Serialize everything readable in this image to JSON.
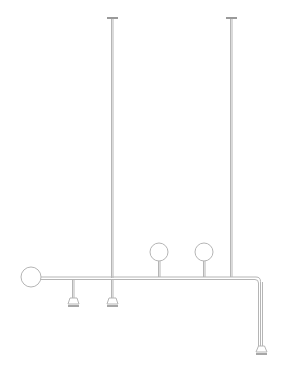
{
  "drawing": {
    "title": "Pendant light fixture line drawing",
    "stroke_color": "#b5b5b5",
    "dark_stroke": "#8a8a8a",
    "background": "#ffffff",
    "canopies": [
      {
        "x": 112,
        "y": 18
      },
      {
        "x": 231,
        "y": 18
      }
    ],
    "globes": [
      {
        "cx": 31,
        "cy": 277,
        "r": 10
      },
      {
        "cx": 159,
        "cy": 252,
        "r": 9
      },
      {
        "cx": 204,
        "cy": 252,
        "r": 9
      }
    ],
    "shades": [
      {
        "x": 73,
        "top": 278,
        "y": 300
      },
      {
        "x": 112,
        "top": 278,
        "y": 300
      },
      {
        "x": 261,
        "top": 288,
        "y": 346
      }
    ],
    "main_bar": {
      "x1": 41,
      "x2": 256,
      "y": 278,
      "bend_x": 261,
      "bend_r": 5
    }
  }
}
